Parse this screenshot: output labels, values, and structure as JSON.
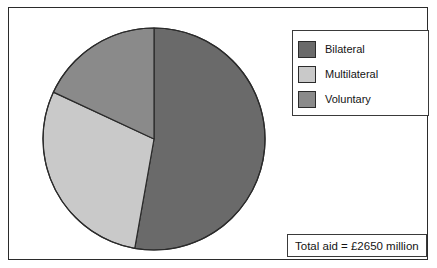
{
  "figure": {
    "background_color": "#ffffff",
    "border_color": "#2b2b2b"
  },
  "legend": {
    "position": "top-right",
    "items": [
      {
        "label": "Bilateral",
        "color": "#6a6a6a"
      },
      {
        "label": "Multilateral",
        "color": "#c9c9c9"
      },
      {
        "label": "Voluntary",
        "color": "#8a8a8a"
      }
    ]
  },
  "caption": {
    "total_aid_text": "Total aid = £2650 million"
  },
  "chart_data": {
    "type": "pie",
    "title": "",
    "subtitle": "",
    "xlabel": "",
    "ylabel": "",
    "grid": false,
    "legend_position": "top-right",
    "total_label": "Total aid = £2650 million",
    "total_value": 2650,
    "total_units": "£ million",
    "start_angle_deg": 0,
    "direction": "clockwise",
    "categories": [
      "Bilateral",
      "Multilateral",
      "Voluntary"
    ],
    "values": [
      52.8,
      29.2,
      18.0
    ],
    "value_units": "percent",
    "colors": [
      "#6a6a6a",
      "#c9c9c9",
      "#8a8a8a"
    ],
    "slices": [
      {
        "name": "Bilateral",
        "percent": 52.8,
        "amount_million_gbp": 1399,
        "color": "#6a6a6a",
        "start_angle_deg": 0,
        "end_angle_deg": 190,
        "sweep_deg": 190
      },
      {
        "name": "Multilateral",
        "percent": 29.2,
        "amount_million_gbp": 773,
        "color": "#c9c9c9",
        "start_angle_deg": 190,
        "end_angle_deg": 295,
        "sweep_deg": 105
      },
      {
        "name": "Voluntary",
        "percent": 18.0,
        "amount_million_gbp": 478,
        "color": "#8a8a8a",
        "start_angle_deg": 295,
        "end_angle_deg": 360,
        "sweep_deg": 65
      }
    ],
    "geometry": {
      "center_x": 112,
      "center_y": 112,
      "radius": 111,
      "outline_color": "#2b2b2b",
      "outline_width": 1.2
    }
  }
}
